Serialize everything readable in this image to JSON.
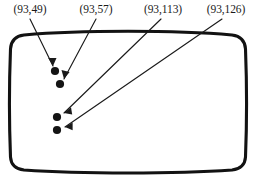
{
  "diagram": {
    "background_color": "#ffffff",
    "ink_color": "#141414",
    "outline": {
      "name": "screen-outline",
      "shape": "rounded-rectangle-barrel",
      "stroke_color": "#121212",
      "stroke_width": 3.1
    },
    "points": [
      {
        "label": "(93,49)",
        "x": 93,
        "y": 49,
        "dot_px": {
          "x": 55,
          "y": 71
        },
        "label_px": {
          "x": 30,
          "y": 13
        },
        "leader_from_px": {
          "x": 30,
          "y": 19
        },
        "leader_to_px": {
          "x": 53,
          "y": 66
        }
      },
      {
        "label": "(93,57)",
        "x": 93,
        "y": 57,
        "dot_px": {
          "x": 60,
          "y": 84
        },
        "label_px": {
          "x": 96,
          "y": 13
        },
        "leader_from_px": {
          "x": 96,
          "y": 19
        },
        "leader_to_px": {
          "x": 64,
          "y": 79
        }
      },
      {
        "label": "(93,113)",
        "x": 93,
        "y": 113,
        "dot_px": {
          "x": 57,
          "y": 117
        },
        "label_px": {
          "x": 163,
          "y": 13
        },
        "leader_from_px": {
          "x": 161,
          "y": 19
        },
        "leader_to_px": {
          "x": 64,
          "y": 113
        }
      },
      {
        "label": "(93,126)",
        "x": 93,
        "y": 126,
        "dot_px": {
          "x": 57,
          "y": 130
        },
        "label_px": {
          "x": 226,
          "y": 13
        },
        "leader_from_px": {
          "x": 222,
          "y": 19
        },
        "leader_to_px": {
          "x": 65,
          "y": 127
        }
      }
    ]
  }
}
